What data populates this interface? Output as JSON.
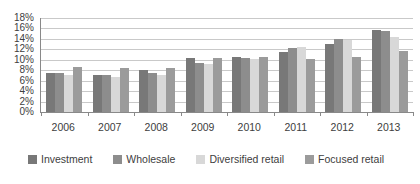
{
  "chart_data": {
    "type": "bar",
    "title": "",
    "categories": [
      "2006",
      "2007",
      "2008",
      "2009",
      "2010",
      "2011",
      "2012",
      "2013"
    ],
    "series": [
      {
        "name": "Investment",
        "color": "#787878",
        "values": [
          7.5,
          7.0,
          8.1,
          10.3,
          10.6,
          11.5,
          13.1,
          15.7
        ]
      },
      {
        "name": "Wholesale",
        "color": "#8d8d8d",
        "values": [
          7.5,
          7.1,
          7.4,
          9.3,
          10.3,
          12.2,
          13.9,
          15.5
        ]
      },
      {
        "name": "Diversified retail",
        "color": "#d8d8d8",
        "values": [
          7.0,
          6.8,
          7.1,
          9.1,
          10.1,
          12.4,
          13.8,
          14.4
        ]
      },
      {
        "name": "Focused retail",
        "color": "#9b9b9b",
        "values": [
          8.7,
          8.4,
          8.5,
          10.3,
          10.5,
          10.1,
          10.6,
          11.6
        ]
      }
    ],
    "xlabel": "",
    "ylabel": "",
    "ylim": [
      0,
      18
    ],
    "ytick_step": 2,
    "yticks": [
      "0%",
      "2%",
      "4%",
      "6%",
      "8%",
      "10%",
      "12%",
      "14%",
      "16%",
      "18%"
    ],
    "grid": true,
    "gridline_color": "#c9c9c9",
    "axis_line_color": "#898989",
    "legend_position": "bottom"
  }
}
